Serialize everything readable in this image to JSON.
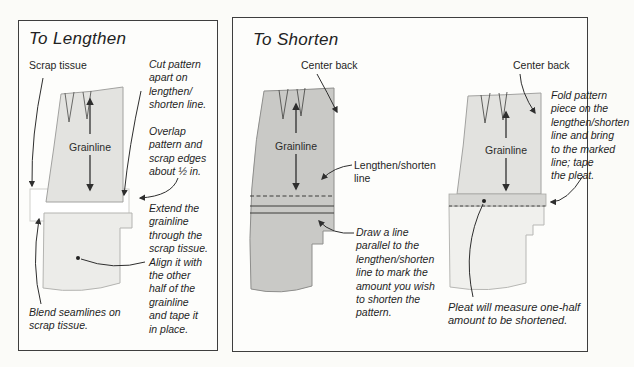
{
  "panels": {
    "lengthen": {
      "title": "To Lengthen",
      "labels": {
        "scrap_tissue": "Scrap tissue",
        "grainline": "Grainline"
      },
      "annotations": {
        "cut_apart": "Cut pattern\napart on\nlengthen/\nshorten line.",
        "overlap": "Overlap\npattern and\nscrap edges\nabout ½ in.",
        "extend": "Extend the\ngrainline\nthrough the\nscrap tissue.\nAlign it with\nthe other\nhalf of  the\ngrainline\nand tape it\nin place.",
        "blend": "Blend seamlines on\nscrap tissue."
      }
    },
    "shorten": {
      "title": "To Shorten",
      "figure_mark": {
        "center_back": "Center back",
        "grainline": "Grainline",
        "lengthen_shorten_line": "Lengthen/shorten\nline",
        "draw_line": "Draw a line\nparallel to the\nlengthen/shorten\nline to mark the\namount you wish\nto shorten the\npattern."
      },
      "figure_fold": {
        "center_back": "Center back",
        "grainline": "Grainline",
        "fold_instruction": "Fold pattern\npiece on the\nlengthen/shorten\nline and bring\nto the marked\nline; tape\nthe pleat.",
        "pleat_note": "Pleat will measure one-half\namount to be shortened."
      }
    }
  },
  "colors": {
    "paper": "#fbfbf8",
    "panel_border": "#3e3e3e",
    "piece_light": "#e3e3e0",
    "piece_lighter": "#ecece9",
    "piece_medium": "#c9c9c6",
    "pleat_band": "#d6d6d3",
    "piece_pale": "#f0f0ed",
    "ink": "#2b2b2b"
  }
}
